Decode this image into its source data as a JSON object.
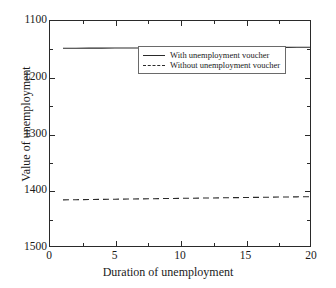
{
  "chart_data": {
    "type": "line",
    "title": "",
    "xlabel": "Duration of unemployment",
    "ylabel": "Value of unemployment",
    "xlim": [
      0,
      20
    ],
    "ylim": [
      1100,
      1500
    ],
    "y_inverted": true,
    "grid": false,
    "legend_position": "upper-right-inside",
    "x_ticks": [
      0,
      5,
      10,
      15,
      20
    ],
    "x_tick_labels": [
      "0",
      "5",
      "10",
      "15",
      "20"
    ],
    "x_minor_step": 2.5,
    "y_ticks": [
      1100,
      1200,
      1300,
      1400,
      1500
    ],
    "y_tick_labels": [
      "1100",
      "1200",
      "1300",
      "1400",
      "1500"
    ],
    "y_minor_step": 50,
    "x": [
      1,
      2,
      3,
      4,
      5,
      6,
      7,
      8,
      9,
      10,
      11,
      12,
      13,
      14,
      15,
      16,
      17,
      18,
      19,
      20
    ],
    "series": [
      {
        "name": "With unemployment voucher",
        "style": "solid",
        "color": "#2a2a2a",
        "values": [
          1148.5,
          1148.4,
          1148.3,
          1148.2,
          1148.1,
          1148.0,
          1147.9,
          1147.8,
          1147.7,
          1147.6,
          1147.5,
          1147.4,
          1147.3,
          1147.2,
          1147.1,
          1147.0,
          1146.9,
          1146.8,
          1146.7,
          1146.6
        ]
      },
      {
        "name": "Without unemployment voucher",
        "style": "dashed",
        "color": "#2a2a2a",
        "values": [
          1418.0,
          1417.7,
          1417.4,
          1417.1,
          1416.8,
          1416.5,
          1416.2,
          1415.9,
          1415.6,
          1415.3,
          1415.0,
          1414.7,
          1414.4,
          1414.1,
          1413.8,
          1413.5,
          1413.2,
          1412.9,
          1412.6,
          1412.3
        ]
      }
    ]
  },
  "legend": {
    "entries": [
      {
        "label": "With unemployment voucher"
      },
      {
        "label": "Without unemployment voucher"
      }
    ]
  },
  "axes": {
    "x_title": "Duration of unemployment",
    "y_title": "Value of unemployment"
  }
}
